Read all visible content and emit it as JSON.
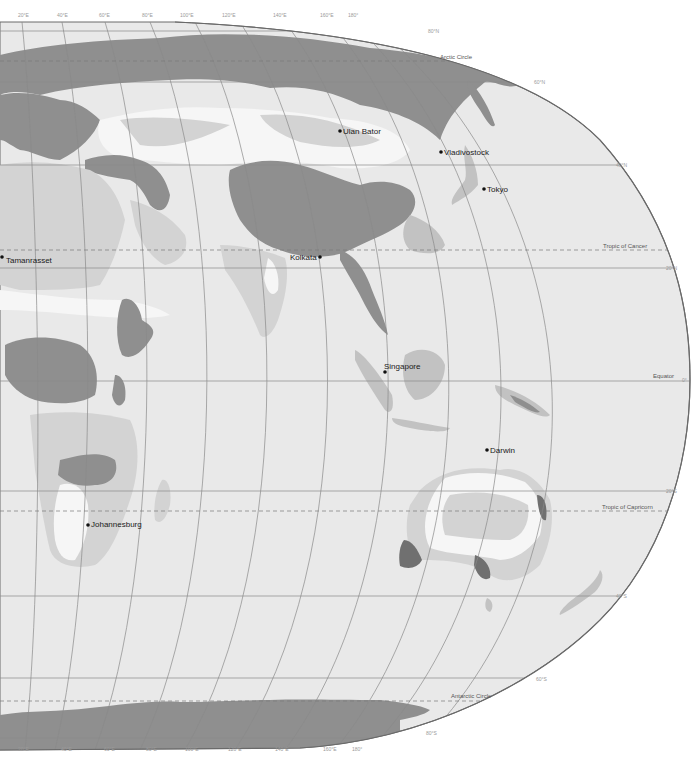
{
  "map": {
    "projection": "world map, eastern hemisphere section (Europe, Africa, Asia, Australia, Antarctica)",
    "colors": {
      "ocean": "#e9e9e9",
      "background": "#ffffff",
      "zone_light": "#f6f6f6",
      "zone_mid_light": "#d3d3d3",
      "zone_mid": "#c2c2c2",
      "zone_dark": "#8f8f8f",
      "zone_darkest": "#707070",
      "graticule": "#8a8a8a",
      "border": "#7a7a7a"
    },
    "longitude_labels_top": [
      "20°E",
      "40°E",
      "60°E",
      "80°E",
      "100°E",
      "120°E",
      "140°E",
      "160°E",
      "180°"
    ],
    "longitude_labels_bottom": [
      "20°E",
      "40°E",
      "60°E",
      "80°E",
      "100°E",
      "120°E",
      "140°E",
      "160°E",
      "180°"
    ],
    "latitude_labels": [
      "80°N",
      "60°N",
      "40°N",
      "20°N",
      "0°",
      "20°S",
      "40°S",
      "60°S",
      "80°S"
    ],
    "reference_lines": {
      "arctic_circle": "Arctic Circle",
      "tropic_of_cancer": "Tropic of Cancer",
      "equator": "Equator",
      "tropic_of_capricorn": "Tropic of Capricorn",
      "antarctic_circle": "Antarctic Circle"
    },
    "cities": [
      {
        "name": "Ulan Bator",
        "x": 340,
        "y": 131
      },
      {
        "name": "Vladivostock",
        "x": 441,
        "y": 152
      },
      {
        "name": "Tokyo",
        "x": 484,
        "y": 189
      },
      {
        "name": "Tamanrasset",
        "x": 2,
        "y": 257
      },
      {
        "name": "Kolkata",
        "x": 320,
        "y": 257
      },
      {
        "name": "Singapore",
        "x": 385,
        "y": 372
      },
      {
        "name": "Darwin",
        "x": 487,
        "y": 450
      },
      {
        "name": "Johannesburg",
        "x": 88,
        "y": 525
      }
    ]
  }
}
